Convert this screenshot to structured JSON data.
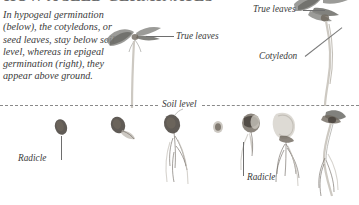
{
  "figure": {
    "heading": "HOW A SEED GERMINATES",
    "intro": "In hypogeal germination (below), the cotyledons, or seed leaves, stay below soil level, whereas in epigeal germination (right), they appear above ground.",
    "soil_level_label": "Soil level",
    "labels": {
      "true_leaves_left": "True leaves",
      "true_leaves_right": "True leaves",
      "cotyledon": "Cotyledon",
      "radicle_left": "Radicle",
      "radicle_right": "Radicle"
    },
    "sequences": {
      "hypogeal": {
        "name": "hypogeal-germination-sequence",
        "stage_count": 3,
        "stages": [
          "seed",
          "seed-with-radicle",
          "seed-with-roots-and-shoot"
        ]
      },
      "epigeal": {
        "name": "epigeal-germination-sequence",
        "stage_count": 4,
        "stages": [
          "seed",
          "swollen-seed",
          "split-seed-with-radicle",
          "seedling-with-roots"
        ]
      }
    },
    "colors": {
      "background": "#ffffff",
      "text": "#3a3a3a",
      "leader_line": "#6e6e6e",
      "soil_line": "#8a8a8a",
      "seed_dark": "#4a443f",
      "leaf_grey": "#8a8a86"
    }
  }
}
